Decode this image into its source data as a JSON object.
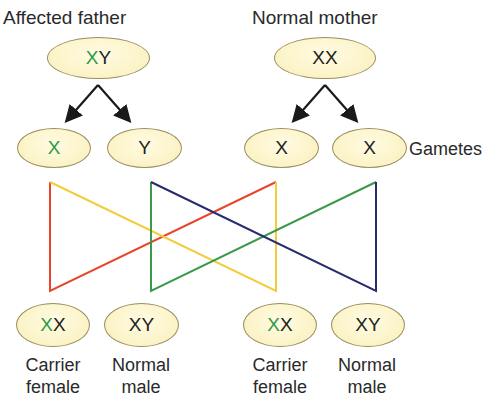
{
  "parents": {
    "father": {
      "label": "Affected father",
      "genotype_affected": "X",
      "genotype_rest": "Y"
    },
    "mother": {
      "label": "Normal mother",
      "genotype_affected": "",
      "genotype_rest": "XX"
    }
  },
  "gametes": {
    "label": "Gametes",
    "items": [
      {
        "affected": "X",
        "rest": ""
      },
      {
        "affected": "",
        "rest": "Y"
      },
      {
        "affected": "",
        "rest": "X"
      },
      {
        "affected": "",
        "rest": "X"
      }
    ]
  },
  "offspring": [
    {
      "affected": "X",
      "rest": "X",
      "line1": "Carrier",
      "line2": "female"
    },
    {
      "affected": "",
      "rest": "XY",
      "line1": "Normal",
      "line2": "male"
    },
    {
      "affected": "X",
      "rest": "X",
      "line1": "Carrier",
      "line2": "female"
    },
    {
      "affected": "",
      "rest": "XY",
      "line1": "Normal",
      "line2": "male"
    }
  ],
  "colors": {
    "affected_allele": "#2f9a46",
    "oval_fill": "#fbf3c6",
    "oval_border": "#9a8d5e",
    "cross_red": "#e8452a",
    "cross_yellow": "#f2cc3a",
    "cross_green": "#3a9a4a",
    "cross_blue": "#2a2a6e",
    "arrow": "#1a1a1a"
  }
}
